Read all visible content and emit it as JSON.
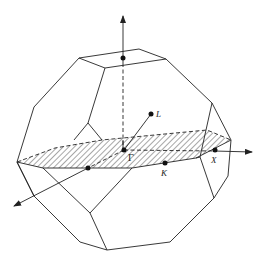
{
  "figure": {
    "labels": {
      "gamma": "Γ",
      "L": "L",
      "K": "K",
      "X": "X"
    },
    "colors": {
      "line": "#222222",
      "background": "#ffffff"
    }
  }
}
